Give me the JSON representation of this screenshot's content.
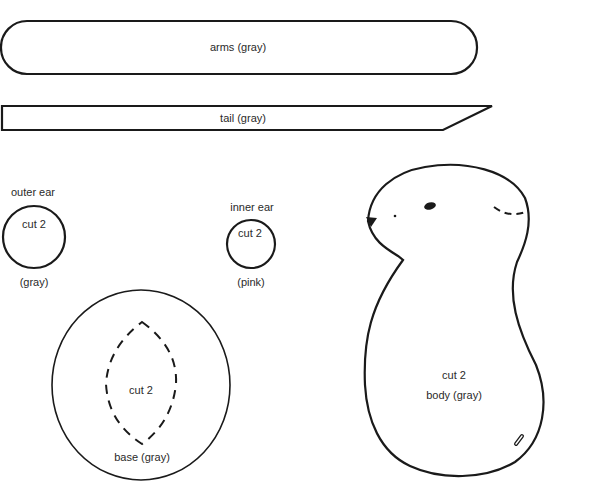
{
  "pieces": {
    "arms": {
      "label": "arms (gray)"
    },
    "tail": {
      "label": "tail (gray)"
    },
    "outer_ear": {
      "title": "outer ear",
      "cut": "cut 2",
      "color": "(gray)"
    },
    "inner_ear": {
      "title": "inner ear",
      "cut": "cut 2",
      "color": "(pink)"
    },
    "base": {
      "cut": "cut 2",
      "label": "base (gray)"
    },
    "body": {
      "cut": "cut 2",
      "label": "body (gray)"
    }
  },
  "colors": {
    "line": "#1a1a1a",
    "text": "#2a2a2a",
    "background": "#ffffff"
  }
}
